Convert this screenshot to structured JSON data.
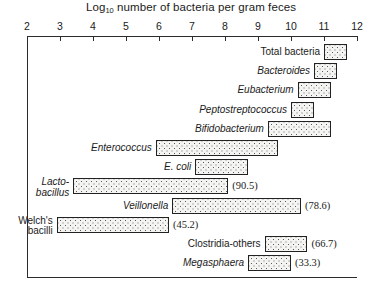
{
  "chart_data": {
    "type": "bar",
    "orientation": "horizontal",
    "title": "Log10 number of bacteria per gram feces",
    "title_main": "Log",
    "title_sub": "10",
    "title_rest": " number of bacteria per gram feces",
    "xlabel": "Log10 number of bacteria per gram feces",
    "ylabel": "",
    "xlim": [
      2,
      12
    ],
    "xticks": [
      2,
      3,
      4,
      5,
      6,
      7,
      8,
      9,
      10,
      11,
      12
    ],
    "xtick_labels": [
      "2",
      "3",
      "4",
      "5",
      "6",
      "7",
      "8",
      "9",
      "10",
      "11",
      "12"
    ],
    "grid": false,
    "legend": "none",
    "value_unit": "log10 CFU per gram feces",
    "annotation_note": "Values in parentheses are detection rates (%) of each organism.",
    "categories": [
      "Total bacteria",
      "Bacteroides",
      "Eubacterium",
      "Peptostreptococcus",
      "Bifidobacterium",
      "Enterococcus",
      "E. coli",
      "Lactobacillus",
      "Veillonella",
      "Welch's bacilli",
      "Clostridia-others",
      "Megasphaera"
    ],
    "bars": [
      {
        "label": "Total bacteria",
        "label_lines": [
          "Total bacteria"
        ],
        "italic": false,
        "x_start": 11.0,
        "x_end": 11.7,
        "percent": ""
      },
      {
        "label": "Bacteroides",
        "label_lines": [
          "Bacteroides"
        ],
        "italic": true,
        "x_start": 10.7,
        "x_end": 11.4,
        "percent": ""
      },
      {
        "label": "Eubacterium",
        "label_lines": [
          "Eubacterium"
        ],
        "italic": true,
        "x_start": 10.2,
        "x_end": 11.2,
        "percent": ""
      },
      {
        "label": "Peptostreptococcus",
        "label_lines": [
          "Peptostreptococcus"
        ],
        "italic": true,
        "x_start": 10.0,
        "x_end": 10.7,
        "percent": ""
      },
      {
        "label": "Bifidobacterium",
        "label_lines": [
          "Bifidobacterium"
        ],
        "italic": true,
        "x_start": 9.3,
        "x_end": 11.2,
        "percent": ""
      },
      {
        "label": "Enterococcus",
        "label_lines": [
          "Enterococcus"
        ],
        "italic": true,
        "x_start": 5.9,
        "x_end": 9.6,
        "percent": ""
      },
      {
        "label": "E. coli",
        "label_lines": [
          "E. coli"
        ],
        "italic": true,
        "x_start": 7.1,
        "x_end": 8.7,
        "percent": ""
      },
      {
        "label": "Lactobacillus",
        "label_lines": [
          "Lacto-",
          "bacillus"
        ],
        "italic": true,
        "x_start": 3.4,
        "x_end": 8.1,
        "percent": "(90.5)"
      },
      {
        "label": "Veillonella",
        "label_lines": [
          "Veillonella"
        ],
        "italic": true,
        "x_start": 6.4,
        "x_end": 10.3,
        "percent": "(78.6)"
      },
      {
        "label": "Welch's bacilli",
        "label_lines": [
          "Welch's",
          "bacilli"
        ],
        "italic": false,
        "x_start": 2.9,
        "x_end": 6.3,
        "percent": "(45.2)"
      },
      {
        "label": "Clostridia-others",
        "label_lines": [
          "Clostridia-others"
        ],
        "italic": false,
        "x_start": 9.2,
        "x_end": 10.5,
        "percent": "(66.7)"
      },
      {
        "label": "Megasphaera",
        "label_lines": [
          "Megasphaera"
        ],
        "italic": true,
        "x_start": 8.7,
        "x_end": 10.0,
        "percent": "(33.3)"
      }
    ],
    "percent_labels": [
      {
        "bar": "Lactobacillus",
        "value": "(90.5)"
      },
      {
        "bar": "Veillonella",
        "value": "(78.6)"
      },
      {
        "bar": "Welch's bacilli",
        "value": "(45.2)"
      },
      {
        "bar": "Clostridia-others",
        "value": "(66.7)"
      },
      {
        "bar": "Megasphaera",
        "value": "(33.3)"
      }
    ],
    "colors": {
      "bar_fill": "#f4f4f2",
      "bar_stipple": "#5b5b5b",
      "bar_border": "#222222",
      "axis": "#2b2b2b",
      "text": "#1a1a1a",
      "background": "#ffffff"
    }
  }
}
